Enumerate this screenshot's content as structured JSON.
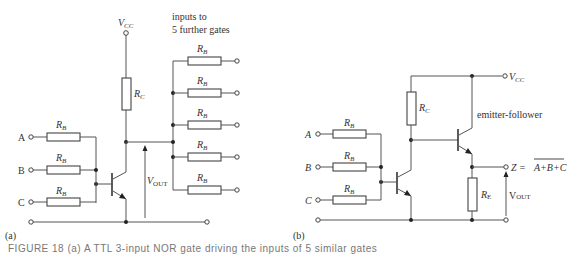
{
  "figure": {
    "panel_a": {
      "label": "(a)",
      "supply": {
        "main": "V",
        "sub": "CC"
      },
      "note_line1": "inputs to",
      "note_line2": "5 further gates",
      "collector_resistor": {
        "main": "R",
        "sub": "C"
      },
      "base_resistor": {
        "main": "R",
        "sub": "B"
      },
      "inputs": [
        "A",
        "B",
        "C"
      ],
      "output_voltage": {
        "main": "V",
        "sub": "OUT"
      },
      "fanout_count": 5
    },
    "panel_b": {
      "label": "(b)",
      "supply": {
        "main": "V",
        "sub": "CC"
      },
      "collector_resistor": {
        "main": "R",
        "sub": "C"
      },
      "base_resistor": {
        "main": "R",
        "sub": "B"
      },
      "emitter_resistor": {
        "main": "R",
        "sub": "E"
      },
      "inputs": [
        "A",
        "B",
        "C"
      ],
      "stage_label": "emitter-follower",
      "output_prefix": "Z =",
      "output_expression": "A+B+C",
      "output_voltage": {
        "main": "V",
        "sub": "OUT"
      }
    },
    "caption": "FIGURE 18  (a) A TTL 3-input NOR gate driving the inputs of 5 similar gates"
  },
  "colors": {
    "wire": "#555555",
    "ink": "#333333",
    "background": "#ffffff"
  }
}
